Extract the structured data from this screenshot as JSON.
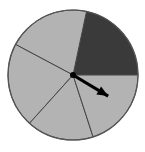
{
  "figure": {
    "name": "spinner-wheel",
    "background_color": "#ffffff",
    "width": 145,
    "height": 152
  },
  "chart_data": {
    "type": "pie",
    "title": "",
    "subtitle": "",
    "xlabel": "",
    "ylabel": "",
    "grid": false,
    "legend": "none",
    "center": {
      "x": 73,
      "y": 75
    },
    "radius": 65,
    "outline_color": "#444444",
    "outline_width": 1,
    "sector_count": 5,
    "categories": [
      "Sector 1",
      "Sector 2",
      "Sector 3",
      "Sector 4",
      "Sector 5"
    ],
    "values": [
      78,
      74,
      76,
      60,
      72
    ],
    "units": "degrees",
    "colors": [
      "#3a3a3a",
      "#b3b3b3",
      "#b3b3b3",
      "#b3b3b3",
      "#b3b3b3"
    ],
    "sectors": [
      {
        "label": "Sector 1",
        "start_angle": 0,
        "end_angle": 78,
        "sweep": 78,
        "color": "#3a3a3a",
        "shade": "dark"
      },
      {
        "label": "Sector 2",
        "start_angle": 78,
        "end_angle": 152,
        "sweep": 74,
        "color": "#b3b3b3",
        "shade": "light"
      },
      {
        "label": "Sector 3",
        "start_angle": 152,
        "end_angle": 228,
        "sweep": 76,
        "color": "#b3b3b3",
        "shade": "light"
      },
      {
        "label": "Sector 4",
        "start_angle": 228,
        "end_angle": 288,
        "sweep": 60,
        "color": "#b3b3b3",
        "shade": "light"
      },
      {
        "label": "Sector 5",
        "start_angle": 288,
        "end_angle": 360,
        "sweep": 72,
        "color": "#b3b3b3",
        "shade": "light"
      }
    ],
    "pointer": {
      "label": "spinner-arrow",
      "angle_degrees": -31,
      "length": 41,
      "color": "#000000",
      "tip": {
        "x": 110,
        "y": 98
      },
      "pivot": {
        "x": 73,
        "y": 75
      },
      "points_at_sector": "Sector 5"
    }
  }
}
